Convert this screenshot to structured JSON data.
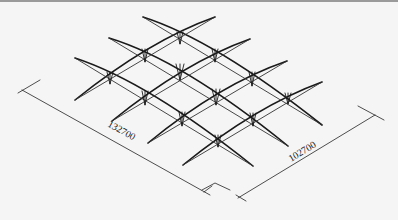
{
  "figure": {
    "type": "isometric structural drawing",
    "line_color": "#1a1a1a",
    "background": "#f5f5f5"
  },
  "dimensions": {
    "length_label": "132700",
    "width_label": "102700"
  }
}
